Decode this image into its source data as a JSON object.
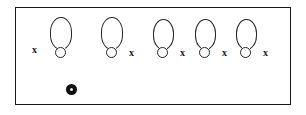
{
  "figure": {
    "background_color": "#ffffff",
    "frame": {
      "name": "diagram-frame",
      "stroke_color": "#1a1a1a",
      "fill_color": "#ffffff",
      "x": 15,
      "y": 7,
      "width": 276,
      "height": 98
    },
    "shapes": [
      {
        "id": 1,
        "kind": "balloon-outline",
        "body": {
          "x": 49,
          "y": 16,
          "width": 22,
          "height": 33
        },
        "neck": {
          "cx": 59,
          "cy": 52,
          "r": 5.5
        },
        "label": "x",
        "label_side": "left",
        "label_x": 31,
        "label_y": 44,
        "stroke_color": "#262626"
      },
      {
        "id": 2,
        "kind": "balloon-outline",
        "body": {
          "x": 100,
          "y": 16,
          "width": 22,
          "height": 33
        },
        "neck": {
          "cx": 110,
          "cy": 52,
          "r": 5.5
        },
        "label": "x",
        "label_side": "right",
        "label_x": 128,
        "label_y": 47,
        "stroke_color": "#262626"
      },
      {
        "id": 3,
        "kind": "balloon-outline",
        "body": {
          "x": 152,
          "y": 18,
          "width": 21,
          "height": 31
        },
        "neck": {
          "cx": 161,
          "cy": 52,
          "r": 5.5
        },
        "label": "x",
        "label_side": "right",
        "label_x": 179,
        "label_y": 47,
        "stroke_color": "#262626"
      },
      {
        "id": 4,
        "kind": "balloon-outline",
        "body": {
          "x": 194,
          "y": 18,
          "width": 21,
          "height": 31
        },
        "neck": {
          "cx": 203,
          "cy": 52,
          "r": 5.5
        },
        "label": "x",
        "label_side": "right",
        "label_x": 221,
        "label_y": 47,
        "stroke_color": "#262626"
      },
      {
        "id": 5,
        "kind": "balloon-outline",
        "body": {
          "x": 235,
          "y": 18,
          "width": 21,
          "height": 31
        },
        "neck": {
          "cx": 244,
          "cy": 52,
          "r": 5.5
        },
        "label": "x",
        "label_side": "right",
        "label_x": 262,
        "label_y": 47,
        "stroke_color": "#262626"
      }
    ],
    "marker": {
      "name": "marker-dot",
      "kind": "filled-dot",
      "cx": 71,
      "cy": 89,
      "r": 5.5,
      "fill_color": "#101010",
      "core_color": "#e8e8e8"
    },
    "shape_count": 5,
    "label_text": "x",
    "label_count": 5
  }
}
